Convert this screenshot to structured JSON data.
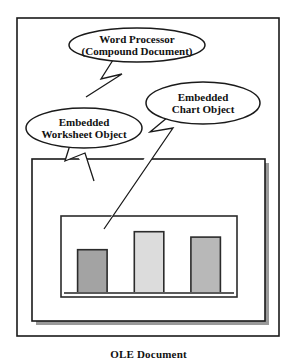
{
  "figure": {
    "caption": "OLE Document",
    "background_color": "#ffffff",
    "line_color": "#1a1a1a"
  },
  "outer_frame": {
    "name": "word-processor-frame",
    "x": 17,
    "y": 18,
    "width": 262,
    "height": 318
  },
  "document_box": {
    "name": "compound-document-box",
    "x": 32,
    "y": 159,
    "width": 233,
    "height": 162,
    "shadow_color": "#9a9a9a"
  },
  "chart_box": {
    "name": "embedded-chart-object-box",
    "x": 61,
    "y": 216,
    "width": 176,
    "height": 81
  },
  "callouts": [
    {
      "id": "word-processor",
      "line1": "Word Processor",
      "line2": "(Compound Document)",
      "cx": 137,
      "cy": 45,
      "rx": 68,
      "ry": 17,
      "tail": "M 113,60 L 101,79 L 122,74 L 86,97"
    },
    {
      "id": "embedded-chart-object",
      "line1": "Embedded",
      "line2": "Chart Object",
      "cx": 203,
      "cy": 103,
      "rx": 57,
      "ry": 21,
      "tail": "M 168,117 L 150,132 L 173,128 L 104,229"
    },
    {
      "id": "embedded-worksheet-object",
      "line1": "Embedded",
      "line2": "Worksheet Object",
      "cx": 84,
      "cy": 128,
      "rx": 58,
      "ry": 20,
      "tail": "M 70,145 L 65,161 L 85,153 L 94,181"
    }
  ],
  "chart_data": {
    "type": "bar",
    "title": "",
    "xlabel": "",
    "ylabel": "",
    "categories": [
      "1",
      "2",
      "3"
    ],
    "values": [
      48,
      68,
      62
    ],
    "ylim": [
      0,
      81
    ],
    "grid": false,
    "legend": "none",
    "bar_colors": [
      "#a3a3a3",
      "#dcdcdc",
      "#b8b8b8"
    ],
    "bar_border_color": "#2b2b2b",
    "baseline_color": "#5a5a5a"
  }
}
